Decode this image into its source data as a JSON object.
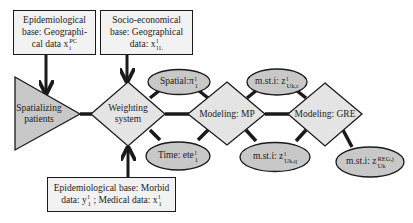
{
  "colors": {
    "node_fill": "#c8c8c8",
    "diamond_fill": "#e4e4e4",
    "box_fill": "#f2f2f2",
    "stroke": "#1a1a1a"
  },
  "boxes": {
    "epi_geo": {
      "line1": "Epidemiological",
      "line2": "base: Geographi-",
      "line3_prefix": "cal data",
      "var": "x",
      "var_sub": "i",
      "var_sup": "PC"
    },
    "socio_geo": {
      "line1": "Socio-economical",
      "line2": "base: Geographical",
      "line3_prefix": "data:",
      "var": "x",
      "var_sub": "l1.",
      "var_sup": "l"
    },
    "epi_morbid": {
      "line1": "Epidemiological base: Morbid",
      "line2_a": "data:",
      "var_y": "y",
      "var_y_sub": "1",
      "var_y_sup": "l",
      "line2_b": "; Medical data:",
      "var_x": "x",
      "var_x_sub": "1",
      "var_x_sup": "l"
    }
  },
  "nodes": {
    "spatializing": {
      "line1": "Spatializing",
      "line2": "patients"
    },
    "weighting": {
      "line1": "Weighting",
      "line2": "system"
    },
    "modeling_mp": {
      "label": "Modeling: MP"
    },
    "modeling_gre": {
      "label": "Modeling: GRE"
    }
  },
  "ellipses": {
    "spatial": {
      "prefix": "Spatial:",
      "var": "π",
      "sub": "1",
      "sup": "l"
    },
    "time": {
      "prefix": "Time:",
      "var": "ete",
      "sub": "1",
      "sup": "l"
    },
    "msti_c": {
      "prefix": "m.st.i:",
      "var": "z",
      "sup": "l",
      "sub": "U",
      "sub2": "k",
      "sub_tail": ",c"
    },
    "msti_q": {
      "prefix": "m.st.i:",
      "var": "z",
      "sup": "l",
      "sub": "U",
      "sub2": "k",
      "sub_tail": ",q"
    },
    "msti_reg": {
      "prefix": "m.st.i:",
      "var": "z",
      "sup": "REG,j",
      "sub": "U",
      "sub2": "k"
    }
  }
}
